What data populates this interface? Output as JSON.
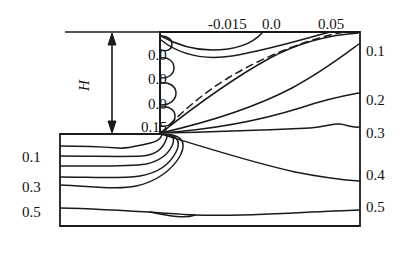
{
  "figure": {
    "type": "contour-plot",
    "background": "#ffffff",
    "line_color": "#1a1a1a"
  },
  "labels": {
    "height_symbol": "H",
    "top_axis": [
      {
        "text": "-0.015",
        "x": 208,
        "y": 17
      },
      {
        "text": "0.0",
        "x": 262,
        "y": 17
      },
      {
        "text": "0.05",
        "x": 318,
        "y": 17
      }
    ],
    "inner_left": [
      {
        "text": "0.0",
        "x": 148,
        "y": 48
      },
      {
        "text": "0.0",
        "x": 148,
        "y": 72
      },
      {
        "text": "0.0",
        "x": 148,
        "y": 97
      },
      {
        "text": "0.15",
        "x": 141,
        "y": 120
      }
    ],
    "left_axis": [
      {
        "text": "0.1",
        "x": 22,
        "y": 150
      },
      {
        "text": "0.3",
        "x": 22,
        "y": 180
      },
      {
        "text": "0.5",
        "x": 22,
        "y": 205
      }
    ],
    "right_axis": [
      {
        "text": "0.1",
        "x": 366,
        "y": 44
      },
      {
        "text": "0.2",
        "x": 366,
        "y": 93
      },
      {
        "text": "0.3",
        "x": 366,
        "y": 126
      },
      {
        "text": "0.4",
        "x": 366,
        "y": 168
      },
      {
        "text": "0.5",
        "x": 366,
        "y": 200
      }
    ]
  },
  "chart_data": {
    "type": "line",
    "title": "",
    "xlabel": "",
    "ylabel": "",
    "legend": "none",
    "grid": false,
    "contour_levels_top": [
      -0.015,
      0.0,
      0.05
    ],
    "contour_levels_left_channel": [
      0.0,
      0.0,
      0.0,
      0.15
    ],
    "contour_levels_left_wall": [
      0.1,
      0.3,
      0.5
    ],
    "contour_levels_right_wall": [
      0.1,
      0.2,
      0.3,
      0.4,
      0.5
    ],
    "dashed_level": 0.0,
    "geometry": {
      "inlet_channel_height_label": "H",
      "step_corner": [
        160,
        134
      ],
      "domain_left": 60,
      "domain_right": 360,
      "domain_top": 32,
      "domain_bottom": 226
    }
  },
  "geom": {
    "outer_box": "M 160 32 L 360 32 L 360 226 L 60 226 L 60 134 L 160 134 Z",
    "top_wall_left": "M 65 32 L 160 32",
    "step_vertical": "M 160 32 L 160 134",
    "step_horizontal": "M 60 134 L 160 134",
    "h_arrow_line": "M 112 34 L 112 132",
    "h_arrow_head_top": "M 112 33 L 108 45 L 116 45 Z",
    "h_arrow_head_bottom": "M 112 133 L 108 121 L 116 121 Z"
  },
  "contours": {
    "upper": [
      "M 161 36 C 175 44 192 50 212 50 C 234 50 252 44 262 33",
      "M 161 40 C 180 55 205 60 232 56 C 268 50 300 40 330 32",
      "M 161 50 C 168 52 172 49 172 44 C 172 39 167 36 161 36",
      "M 161 78 C 169 78 174 74 174 68 C 174 61 168 57 161 58",
      "M 161 105 C 170 105 176 100 176 93 C 176 86 169 82 161 83",
      "M 161 126 C 169 127 175 123 175 116 C 175 110 169 106 162 107",
      "M 161 133 C 190 110 230 80 270 58 C 300 42 330 35 358 33"
    ],
    "upper_dashed": "M 161 133 C 178 116 200 95 228 78 C 268 54 312 38 344 32",
    "radiating": [
      "M 161 133 C 200 124 250 110 292 88 C 322 72 344 55 359 44",
      "M 161 133 C 205 130 255 122 300 108 C 330 98 348 95 359 93",
      "M 161 133 C 210 132 265 130 310 128 C 326 127 333 123 340 124 C 348 125 352 128 359 127"
    ],
    "lower": [
      "M 60 146 C 85 146 105 147 118 148 C 128 149 136 146 146 144 C 156 142 160 140 162 135",
      "M 60 156 C 95 156 125 157 142 156 C 156 155 163 148 166 140 C 169 133 165 134 161 134",
      "M 60 166 C 95 166 128 167 146 164 C 160 161 168 154 172 146 C 176 137 172 134 161 134",
      "M 60 177 C 90 177 120 179 140 176 C 158 173 170 164 176 152 C 182 140 176 134 161 134",
      "M 60 185 C 90 186 118 190 136 186 C 156 182 172 170 180 156 C 188 140 180 134 161 134",
      "M 161 134 C 200 146 250 162 295 172 C 325 178 345 180 359 181",
      "M 60 208 C 110 209 160 213 195 215 C 240 217 300 212 359 210"
    ],
    "bottom_wiggle": "M 150 212 C 170 216 185 219 195 215"
  }
}
